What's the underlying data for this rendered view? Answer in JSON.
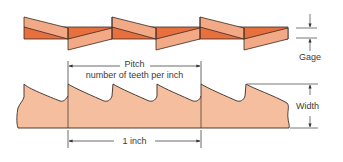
{
  "diagram": {
    "colors": {
      "set_light": "#f2a985",
      "set_dark": "#e8703f",
      "blade_fill": "#f5bf9f",
      "outline": "#3b2a22",
      "dimension_line": "#444444"
    },
    "labels": {
      "gage": "Gage",
      "pitch": "Pitch",
      "pitch_sub": "number of teeth per inch",
      "width": "Width",
      "one_inch": "1 inch"
    }
  }
}
